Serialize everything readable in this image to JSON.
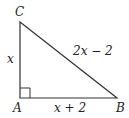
{
  "diagram": {
    "type": "right-triangle",
    "vertices": {
      "A": {
        "label": "A",
        "x": 20,
        "y": 98
      },
      "B": {
        "label": "B",
        "x": 117,
        "y": 98
      },
      "C": {
        "label": "C",
        "x": 20,
        "y": 22
      }
    },
    "right_angle_at": "A",
    "sides": {
      "AC": {
        "label": "x"
      },
      "AB": {
        "label": "x + 2"
      },
      "BC": {
        "label": "2x − 2"
      }
    },
    "stroke_color": "#333333"
  }
}
